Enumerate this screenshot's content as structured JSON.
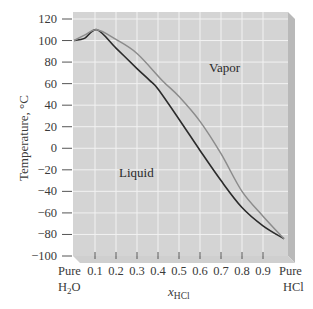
{
  "chart_data": {
    "type": "line",
    "title": "",
    "xlabel": "x_HCl",
    "xlabel_main": "x",
    "xlabel_sub": "HCl",
    "ylabel": "Temperature, °C",
    "xlim": [
      0,
      1
    ],
    "ylim": [
      -100,
      120
    ],
    "grid": true,
    "x_ticks": [
      "Pure H2O",
      "0.1",
      "0.2",
      "0.3",
      "0.4",
      "0.5",
      "0.6",
      "0.7",
      "0.8",
      "0.9",
      "Pure HCl"
    ],
    "x_tick_values": [
      0,
      0.1,
      0.2,
      0.3,
      0.4,
      0.5,
      0.6,
      0.7,
      0.8,
      0.9,
      1.0
    ],
    "y_ticks": [
      120,
      100,
      80,
      60,
      40,
      20,
      0,
      -20,
      -40,
      -60,
      -80,
      -100
    ],
    "annotations": [
      {
        "text": "Vapor",
        "x": 0.65,
        "y": 68
      },
      {
        "text": "Liquid",
        "x": 0.22,
        "y": -27
      }
    ],
    "series": [
      {
        "name": "Liquid (bubble-point) curve",
        "color": "#2b2b2b",
        "x": [
          0,
          0.05,
          0.11,
          0.2,
          0.3,
          0.36,
          0.4,
          0.5,
          0.6,
          0.7,
          0.8,
          0.9,
          1.0
        ],
        "y": [
          100,
          102,
          110,
          93,
          74,
          63,
          55,
          27,
          -2,
          -30,
          -55,
          -72,
          -84
        ]
      },
      {
        "name": "Vapor (dew-point) curve",
        "color": "#8c8c8c",
        "x": [
          0,
          0.05,
          0.11,
          0.2,
          0.3,
          0.42,
          0.5,
          0.6,
          0.7,
          0.8,
          0.9,
          1.0
        ],
        "y": [
          100,
          105,
          110,
          101,
          88,
          63,
          48,
          25,
          -5,
          -40,
          -63,
          -84
        ]
      }
    ]
  },
  "labels": {
    "ylabel": "Temperature, °C",
    "xlabel_main": "x",
    "xlabel_sub": "HCl",
    "vapor": "Vapor",
    "liquid": "Liquid",
    "pure_left_line1": "Pure",
    "pure_left_line2": "H",
    "pure_left_sub": "2",
    "pure_left_line2b": "O",
    "pure_right_line1": "Pure",
    "pure_right_line2": "HCl"
  }
}
